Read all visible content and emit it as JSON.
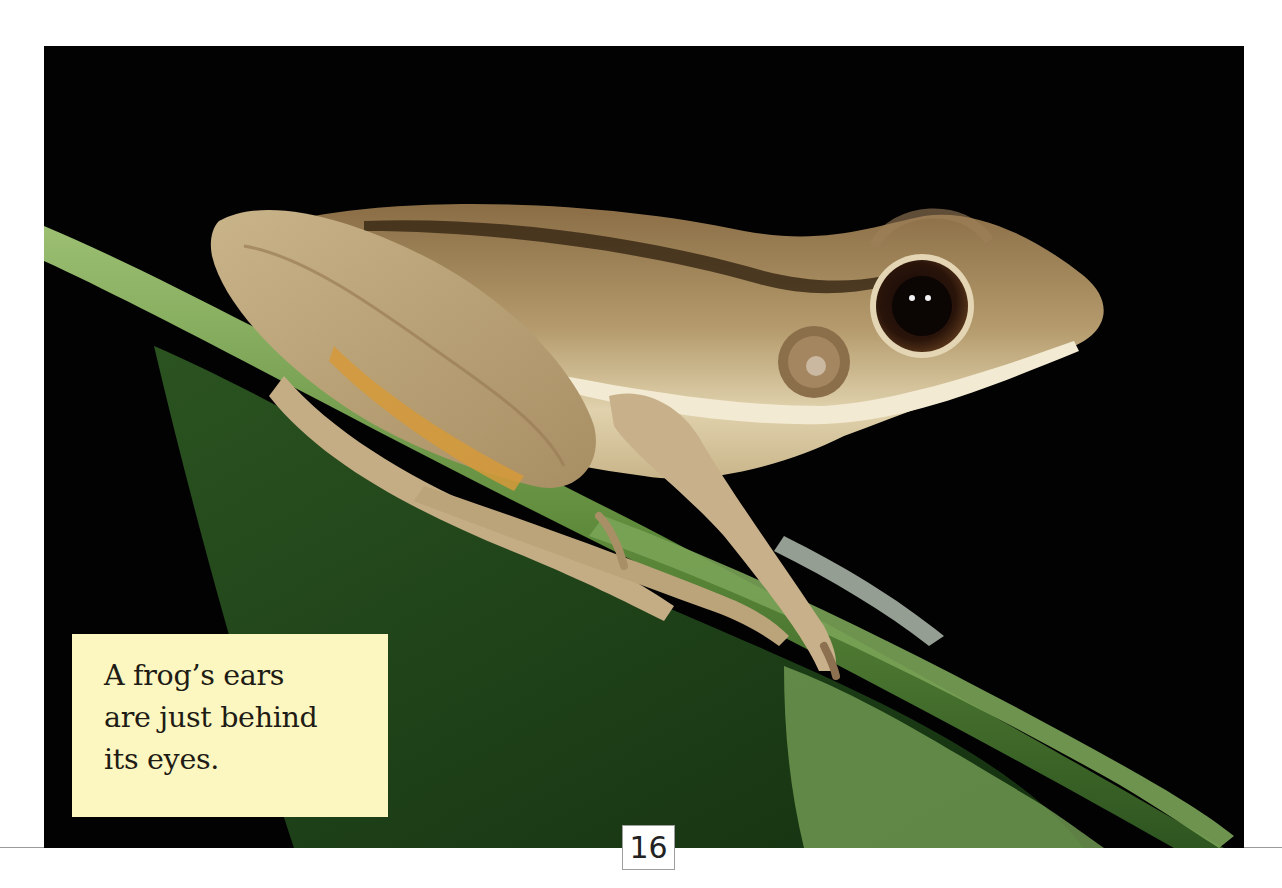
{
  "page": {
    "page_number": "16",
    "background_color": "#ffffff",
    "rule_color": "#9a9a9a"
  },
  "photo": {
    "subject": "frog sitting on green leaf against black background",
    "colors": {
      "background": "#020203",
      "frog_body": "#b59c6e",
      "frog_light": "#d8c7a0",
      "frog_dark": "#5a4326",
      "leaf_dark": "#1f3d1a",
      "leaf_mid": "#3f6a2c",
      "leaf_light": "#8fae6a",
      "eye": "#1a0c06"
    }
  },
  "caption": {
    "lines": [
      "A frog’s ears",
      "are just behind",
      "its eyes."
    ],
    "background_color": "#fcf6c0",
    "text_color": "#1e1c14"
  }
}
